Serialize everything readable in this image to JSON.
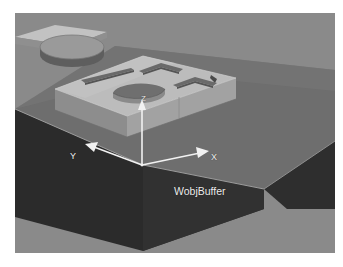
{
  "figure": {
    "background_color": "#8a8a8a",
    "page_color": "#ffffff"
  },
  "scene": {
    "base_block": {
      "name": "buffer-base-block",
      "top_face_color": "#6e6e6e",
      "front_left_face_color": "#2b2b2b",
      "front_right_face_color": "#3a3a3a",
      "shadow_color": "#787878"
    },
    "fixture_plate": {
      "name": "fixture-plate",
      "top_face_color": "#b9b9b9",
      "front_face_color": "#9d9d9d",
      "side_face_color": "#8d8d8d",
      "features": [
        {
          "name": "circular-recess",
          "shape": "circle"
        },
        {
          "name": "horizontal-slot",
          "shape": "slot"
        },
        {
          "name": "chevron-slot-left",
          "shape": "chevron"
        },
        {
          "name": "chevron-slot-right",
          "shape": "chevron"
        }
      ]
    },
    "cylinder_puck": {
      "name": "cylinder-puck",
      "top_face_color": "#9a9a9a",
      "side_face_color": "#636363"
    },
    "secondary_plate": {
      "name": "secondary-plate-partial",
      "top_face_color": "#c2c2c2",
      "front_face_color": "#8f8f8f"
    }
  },
  "coordinate_frame": {
    "name": "WobjBuffer",
    "label": "WobjBuffer",
    "color": "#f2f2f2",
    "axes": [
      {
        "id": "x",
        "label": "X",
        "direction": "right-forward"
      },
      {
        "id": "y",
        "label": "Y",
        "direction": "left-forward"
      },
      {
        "id": "z",
        "label": "Z",
        "direction": "up"
      }
    ]
  }
}
